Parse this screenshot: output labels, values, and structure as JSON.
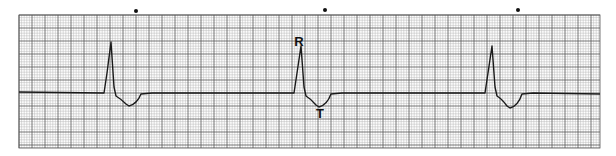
{
  "strip": {
    "grid": {
      "x0": 19,
      "y0": 15,
      "x1": 600,
      "y1": 148,
      "minor_px": 2.6,
      "major_px": 13,
      "minor_color": "#b8b8b8",
      "major_color": "#555555",
      "background": "#ffffff"
    },
    "trace_color": "#1a1a1a",
    "baseline_y": 93,
    "markers": [
      {
        "x": 136,
        "y": 11
      },
      {
        "x": 325,
        "y": 10
      },
      {
        "x": 518,
        "y": 10
      }
    ],
    "beats": [
      {
        "onset_x": 104,
        "r_x": 111,
        "r_y": 42,
        "t_x": 129,
        "t_y": 106,
        "end_x": 152
      },
      {
        "onset_x": 294,
        "r_x": 301,
        "r_y": 46,
        "t_x": 319,
        "t_y": 107,
        "end_x": 342
      },
      {
        "onset_x": 485,
        "r_x": 492,
        "r_y": 46,
        "t_x": 510,
        "t_y": 108,
        "end_x": 533
      }
    ],
    "labels": [
      {
        "text": "R",
        "x": 299,
        "y": 46,
        "name": "r-wave-label"
      },
      {
        "text": "T",
        "x": 320,
        "y": 118,
        "name": "t-wave-label"
      }
    ]
  }
}
